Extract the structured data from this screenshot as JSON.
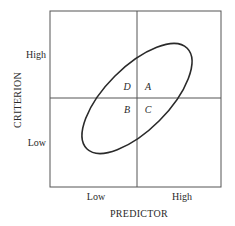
{
  "diagram": {
    "type": "expectancy-scatter-quadrants",
    "x_axis": {
      "title": "PREDICTOR",
      "ticks": [
        "Low",
        "High"
      ]
    },
    "y_axis": {
      "title": "CRITERION",
      "ticks": [
        "High",
        "Low"
      ]
    },
    "quadrants": {
      "upper_left": "D",
      "upper_right": "A",
      "lower_left": "B",
      "lower_right": "C"
    },
    "shape": "ellipse",
    "shape_orientation": "positive-correlation"
  },
  "colors": {
    "line": "#2a2a2a",
    "background": "#ffffff"
  }
}
